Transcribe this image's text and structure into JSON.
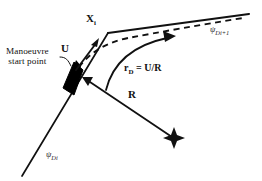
{
  "figure": {
    "type": "navigation-waypoint-turn-diagram",
    "background_color": "#ffffff",
    "line_color": "#111111",
    "vessel_color": "#000000"
  },
  "labels": {
    "manoeuvre_start_line1": "Manoeuvre",
    "manoeuvre_start_line2": "start point",
    "waypoint": "X",
    "waypoint_sub": "i",
    "speed": "U",
    "radius": "R",
    "turn_rate_symbol": "r",
    "turn_rate_sub": "D",
    "turn_rate_equation": " = U/R",
    "track_inbound": "ψ",
    "track_inbound_sub": "Di",
    "track_outbound": "ψ",
    "track_outbound_sub": "Di+1"
  },
  "elements": {
    "inbound_leg_name": "inbound-track-line",
    "outbound_leg_name": "outbound-track-line",
    "actual_path_name": "dashed-actual-path",
    "turn_arrow_name": "turn-direction-arrow",
    "radius_line_name": "radius-line",
    "center_marker_name": "turn-center-cross",
    "vessel_name": "vessel-marker",
    "velocity_arrow_name": "velocity-arrow",
    "leader_line_name": "callout-leader-line"
  }
}
